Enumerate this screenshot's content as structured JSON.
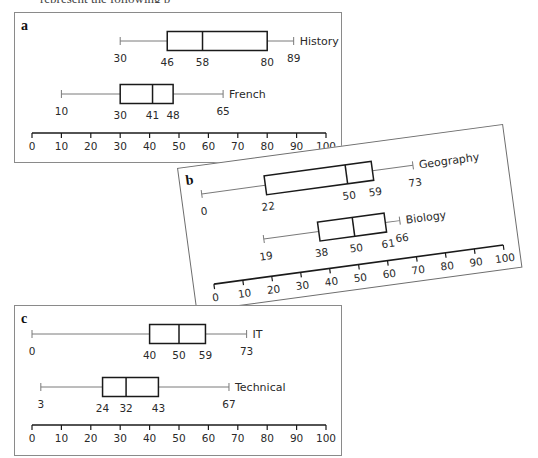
{
  "page": {
    "top_cropped_text": "represent the following p"
  },
  "style": {
    "box_color": "#1a1a1a",
    "whisker_color": "#7a7a7a",
    "axis_color": "#1a1a1a",
    "text_color": "#2a2a2a"
  },
  "chart_data": [
    {
      "type": "boxplot",
      "panel": "a",
      "title": "a",
      "xlabel": "",
      "xlim": [
        0,
        100
      ],
      "xticks": [
        0,
        10,
        20,
        30,
        40,
        50,
        60,
        70,
        80,
        90,
        100
      ],
      "grid": false,
      "series": [
        {
          "name": "History",
          "min": 30,
          "q1": 46,
          "median": 58,
          "q3": 80,
          "max": 89
        },
        {
          "name": "French",
          "min": 10,
          "q1": 30,
          "median": 41,
          "q3": 48,
          "max": 65
        }
      ]
    },
    {
      "type": "boxplot",
      "panel": "b",
      "title": "b",
      "xlabel": "",
      "xlim": [
        0,
        100
      ],
      "xticks": [
        0,
        10,
        20,
        30,
        40,
        50,
        60,
        70,
        80,
        90,
        100
      ],
      "grid": false,
      "rotation_deg": -7.7,
      "series": [
        {
          "name": "Geography",
          "min": 0,
          "q1": 22,
          "median": 50,
          "q3": 59,
          "max": 73
        },
        {
          "name": "Biology",
          "min": 19,
          "q1": 38,
          "median": 50,
          "q3": 61,
          "max": 66
        }
      ]
    },
    {
      "type": "boxplot",
      "panel": "c",
      "title": "c",
      "xlabel": "",
      "xlim": [
        0,
        100
      ],
      "xticks": [
        0,
        10,
        20,
        30,
        40,
        50,
        60,
        70,
        80,
        90,
        100
      ],
      "grid": false,
      "series": [
        {
          "name": "IT",
          "min": 0,
          "q1": 40,
          "median": 50,
          "q3": 59,
          "max": 73
        },
        {
          "name": "Technical",
          "min": 3,
          "q1": 24,
          "median": 32,
          "q3": 43,
          "max": 67
        }
      ]
    }
  ]
}
